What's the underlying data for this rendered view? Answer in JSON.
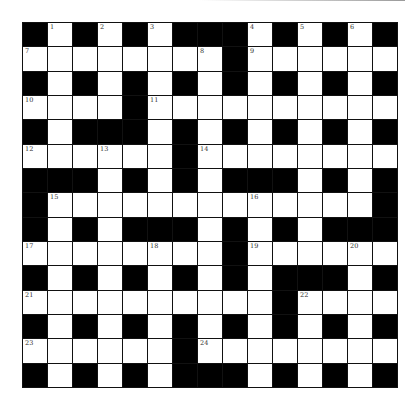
{
  "puzzle": {
    "type": "crossword",
    "rows": 15,
    "cols": 15,
    "grid": [
      "#.#.#.###.#.#.#",
      "........#......",
      "#.#.#.#.#.#.#.#",
      "....#..........",
      "#.###.#.#.#.#.#",
      "......#........",
      "###.#.#.###.#.#",
      "#.............#",
      "#.#.###.#.#.###",
      "........#......",
      "#.#.#.#.#.###.#",
      "..........#....",
      "#.#.#.#.#.#.#.#",
      "......#........",
      "#.#.#.###.#.#.#"
    ],
    "numbers": [
      {
        "row": 0,
        "col": 1,
        "n": "1"
      },
      {
        "row": 0,
        "col": 3,
        "n": "2"
      },
      {
        "row": 0,
        "col": 5,
        "n": "3"
      },
      {
        "row": 0,
        "col": 9,
        "n": "4"
      },
      {
        "row": 0,
        "col": 11,
        "n": "5"
      },
      {
        "row": 0,
        "col": 13,
        "n": "6"
      },
      {
        "row": 1,
        "col": 0,
        "n": "7"
      },
      {
        "row": 1,
        "col": 7,
        "n": "8"
      },
      {
        "row": 1,
        "col": 9,
        "n": "9"
      },
      {
        "row": 3,
        "col": 0,
        "n": "10"
      },
      {
        "row": 3,
        "col": 5,
        "n": "11"
      },
      {
        "row": 5,
        "col": 0,
        "n": "12"
      },
      {
        "row": 5,
        "col": 3,
        "n": "13"
      },
      {
        "row": 5,
        "col": 7,
        "n": "14"
      },
      {
        "row": 7,
        "col": 1,
        "n": "15"
      },
      {
        "row": 7,
        "col": 9,
        "n": "16"
      },
      {
        "row": 9,
        "col": 0,
        "n": "17"
      },
      {
        "row": 9,
        "col": 5,
        "n": "18"
      },
      {
        "row": 9,
        "col": 9,
        "n": "19"
      },
      {
        "row": 9,
        "col": 13,
        "n": "20"
      },
      {
        "row": 11,
        "col": 0,
        "n": "21"
      },
      {
        "row": 11,
        "col": 11,
        "n": "22"
      },
      {
        "row": 13,
        "col": 0,
        "n": "23"
      },
      {
        "row": 13,
        "col": 7,
        "n": "24"
      }
    ],
    "colors": {
      "block": "#000000",
      "cell": "#ffffff",
      "number": "#333333"
    }
  }
}
